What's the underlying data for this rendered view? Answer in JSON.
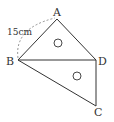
{
  "diagram": {
    "points": [
      {
        "id": "A",
        "label": "A"
      },
      {
        "id": "B",
        "label": "B"
      },
      {
        "id": "C",
        "label": "C"
      },
      {
        "id": "D",
        "label": "D"
      }
    ],
    "segments": [
      "AB",
      "AD",
      "BD",
      "BC",
      "DC"
    ],
    "measurement": {
      "segment": "AB",
      "label": "15cm"
    },
    "angle_marks": [
      {
        "triangle": "ABD",
        "symbol": "○"
      },
      {
        "triangle": "BCD",
        "symbol": "○"
      }
    ],
    "stroke_color": "#333333"
  }
}
